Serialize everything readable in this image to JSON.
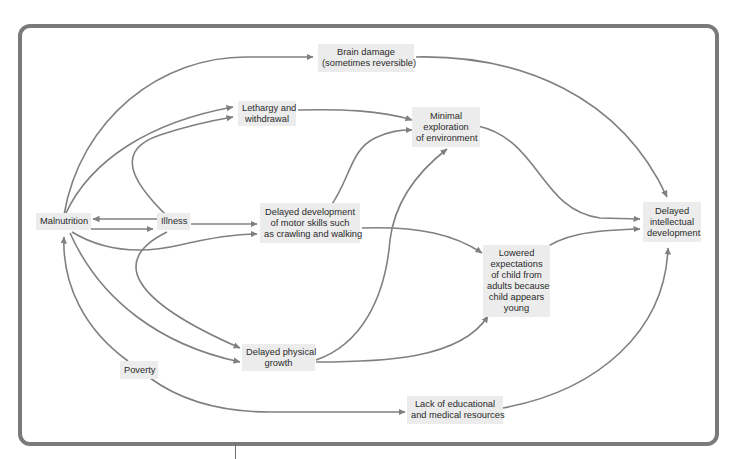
{
  "diagram": {
    "type": "causal-flow-diagram",
    "colors": {
      "arrow": "#808080",
      "node_bg": "#ececec",
      "frame": "#7a7a7a",
      "text": "#2a2a2a"
    },
    "nodes": {
      "malnutrition": {
        "lines": [
          "Malnutrition"
        ]
      },
      "illness": {
        "lines": [
          "Illness"
        ]
      },
      "poverty": {
        "lines": [
          "Poverty"
        ]
      },
      "brain_damage": {
        "lines": [
          "Brain damage",
          "(sometimes reversible)"
        ]
      },
      "lethargy": {
        "lines": [
          "Lethargy and",
          "withdrawal"
        ]
      },
      "minimal_exploration": {
        "lines": [
          "Minimal",
          "exploration",
          "of environment"
        ]
      },
      "delayed_motor": {
        "lines": [
          "Delayed development",
          "of motor skills such",
          "as crawling and walking"
        ]
      },
      "lowered_expectations": {
        "lines": [
          "Lowered",
          "expectations",
          "of child from",
          "adults because",
          "child appears",
          "young"
        ]
      },
      "delayed_physical": {
        "lines": [
          "Delayed physical",
          "growth"
        ]
      },
      "lack_resources": {
        "lines": [
          "Lack of educational",
          "and medical resources"
        ]
      },
      "delayed_intellectual": {
        "lines": [
          "Delayed",
          "intellectual",
          "development"
        ]
      }
    },
    "edges": [
      {
        "from": "malnutrition",
        "to": "brain_damage"
      },
      {
        "from": "malnutrition",
        "to": "lethargy"
      },
      {
        "from": "malnutrition",
        "to": "illness"
      },
      {
        "from": "illness",
        "to": "malnutrition"
      },
      {
        "from": "illness",
        "to": "lethargy"
      },
      {
        "from": "illness",
        "to": "delayed_motor"
      },
      {
        "from": "illness",
        "to": "delayed_physical"
      },
      {
        "from": "malnutrition",
        "to": "delayed_motor"
      },
      {
        "from": "malnutrition",
        "to": "delayed_physical"
      },
      {
        "from": "poverty",
        "to": "malnutrition"
      },
      {
        "from": "poverty",
        "to": "lack_resources"
      },
      {
        "from": "lethargy",
        "to": "minimal_exploration"
      },
      {
        "from": "delayed_motor",
        "to": "minimal_exploration"
      },
      {
        "from": "delayed_motor",
        "to": "lowered_expectations"
      },
      {
        "from": "delayed_physical",
        "to": "minimal_exploration"
      },
      {
        "from": "delayed_physical",
        "to": "lowered_expectations"
      },
      {
        "from": "brain_damage",
        "to": "delayed_intellectual"
      },
      {
        "from": "minimal_exploration",
        "to": "delayed_intellectual"
      },
      {
        "from": "lowered_expectations",
        "to": "delayed_intellectual"
      },
      {
        "from": "lack_resources",
        "to": "delayed_intellectual"
      }
    ]
  }
}
